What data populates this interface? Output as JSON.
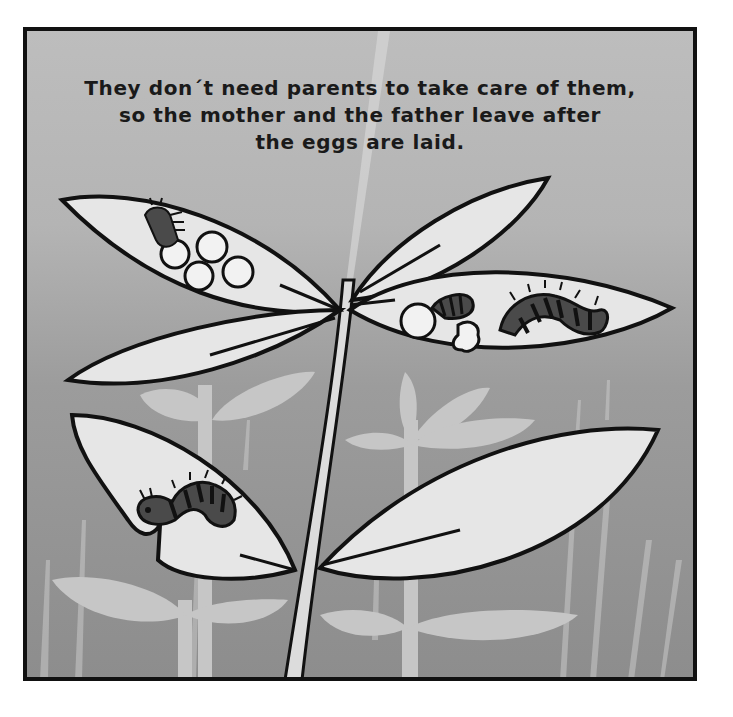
{
  "caption": {
    "lines": [
      "They don´t need parents to take care of them,",
      "so the mother and the father leave after",
      "the eggs are laid."
    ]
  },
  "illustration": {
    "subject": "caterpillars and eggs on plant leaves",
    "palette": {
      "background_top": "#bdbdbd",
      "background_bottom": "#8d8d8d",
      "leaf_fill": "#e4e4e4",
      "outline": "#111111",
      "background_plants": "#c8c8c8",
      "caterpillar_body": "#4a4a4a"
    },
    "elements": {
      "eggs_top_left_leaf": 4,
      "eggs_right_leaf": 1,
      "caterpillars": 4
    }
  }
}
